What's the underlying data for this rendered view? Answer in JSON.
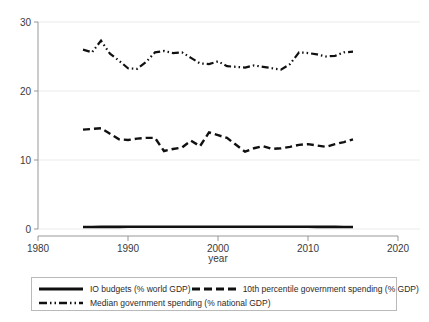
{
  "chart_data": {
    "type": "line",
    "title": "",
    "xlabel": "year",
    "ylabel": "",
    "xlim": [
      1980,
      2020
    ],
    "ylim": [
      0,
      30
    ],
    "xticks": [
      1980,
      1990,
      2000,
      2010,
      2020
    ],
    "yticks": [
      0,
      10,
      20,
      30
    ],
    "grid": "horizontal",
    "legend_position": "bottom",
    "x": [
      1985,
      1986,
      1987,
      1988,
      1989,
      1990,
      1991,
      1992,
      1993,
      1994,
      1995,
      1996,
      1997,
      1998,
      1999,
      2000,
      2001,
      2002,
      2003,
      2004,
      2005,
      2006,
      2007,
      2008,
      2009,
      2010,
      2011,
      2012,
      2013,
      2014,
      2015
    ],
    "series": [
      {
        "name": "IO budgets (% world GDP)",
        "style": "solid",
        "values": [
          0.3,
          0.3,
          0.31,
          0.31,
          0.31,
          0.32,
          0.32,
          0.33,
          0.33,
          0.33,
          0.33,
          0.33,
          0.32,
          0.32,
          0.32,
          0.33,
          0.33,
          0.33,
          0.33,
          0.33,
          0.33,
          0.32,
          0.32,
          0.32,
          0.32,
          0.32,
          0.31,
          0.31,
          0.31,
          0.3,
          0.3
        ]
      },
      {
        "name": "10th percentile government spending (% GDP)",
        "style": "dashed",
        "values": [
          14.4,
          14.5,
          14.6,
          13.8,
          13.0,
          12.9,
          13.1,
          13.2,
          13.2,
          11.3,
          11.6,
          11.8,
          12.8,
          12.0,
          14.0,
          13.6,
          13.2,
          12.2,
          11.2,
          11.7,
          12.0,
          11.6,
          11.7,
          11.9,
          12.2,
          12.3,
          12.1,
          11.9,
          12.3,
          12.6,
          13.0
        ]
      },
      {
        "name": "Median government spending (% national GDP)",
        "style": "dash-dot",
        "values": [
          26.0,
          25.6,
          27.3,
          25.4,
          24.4,
          23.3,
          23.2,
          24.2,
          25.6,
          25.8,
          25.5,
          25.6,
          24.8,
          24.0,
          23.9,
          24.3,
          23.6,
          23.5,
          23.4,
          23.7,
          23.5,
          23.3,
          23.1,
          23.9,
          25.6,
          25.5,
          25.3,
          25.0,
          25.1,
          25.6,
          25.7
        ]
      }
    ]
  },
  "axis": {
    "x_title": "year",
    "x_tick_labels": [
      "1980",
      "1990",
      "2000",
      "2010",
      "2020"
    ],
    "y_tick_labels": [
      "0",
      "10",
      "20",
      "30"
    ]
  },
  "legend": {
    "entries": [
      {
        "label": "IO budgets (% world GDP)",
        "style": "solid"
      },
      {
        "label": "10th percentile government spending (% GDP)",
        "style": "dashed"
      },
      {
        "label": "Median government spending (% national GDP)",
        "style": "dash-dot"
      }
    ]
  },
  "colors": {
    "series": "#101010",
    "grid": "#e6e6e6",
    "axis": "#8c8c8c",
    "background": "#ffffff",
    "legend_border": "#b9b9b9"
  }
}
